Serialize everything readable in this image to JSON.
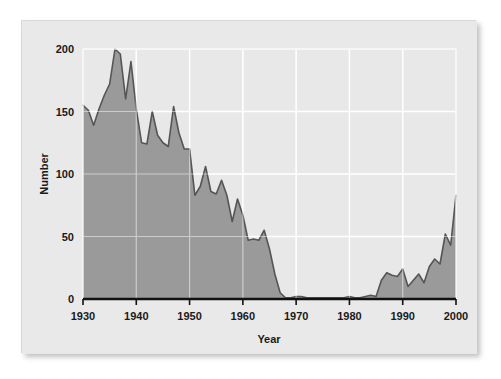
{
  "chart_data": {
    "type": "area",
    "title": "",
    "xlabel": "Year",
    "ylabel": "Number",
    "xlim": [
      1930,
      2000
    ],
    "ylim": [
      0,
      200
    ],
    "xticks": [
      1930,
      1940,
      1950,
      1960,
      1970,
      1980,
      1990,
      2000
    ],
    "xtick_labels": [
      "1930",
      "1940",
      "1950",
      "1960",
      "1970",
      "1980",
      "1990",
      "2000"
    ],
    "yticks": [
      0,
      50,
      100,
      150,
      200
    ],
    "ytick_labels": [
      "0",
      "50",
      "100",
      "150",
      "200"
    ],
    "grid": true,
    "legend": null,
    "legend_position": "none",
    "colors": {
      "plot_background": "#e8e8e8",
      "gridline": "#ffffff",
      "area_fill": "#9a9a9a",
      "line_stroke": "#555555",
      "baseline": "#111111",
      "card_background": "#e9e9e9",
      "page_background": "#ffffff",
      "text": "#1a1a1a"
    },
    "x": [
      1930,
      1931,
      1932,
      1933,
      1934,
      1935,
      1936,
      1937,
      1938,
      1939,
      1940,
      1941,
      1942,
      1943,
      1944,
      1945,
      1946,
      1947,
      1948,
      1949,
      1950,
      1951,
      1952,
      1953,
      1954,
      1955,
      1956,
      1957,
      1958,
      1959,
      1960,
      1961,
      1962,
      1963,
      1964,
      1965,
      1966,
      1967,
      1968,
      1969,
      1970,
      1971,
      1972,
      1973,
      1974,
      1975,
      1976,
      1977,
      1978,
      1979,
      1980,
      1981,
      1982,
      1983,
      1984,
      1985,
      1986,
      1987,
      1988,
      1989,
      1990,
      1991,
      1992,
      1993,
      1994,
      1995,
      1996,
      1997,
      1998,
      1999,
      2000
    ],
    "values": [
      155,
      151,
      139,
      152,
      163,
      172,
      200,
      196,
      160,
      190,
      152,
      125,
      124,
      150,
      131,
      125,
      122,
      154,
      133,
      120,
      120,
      83,
      90,
      106,
      86,
      84,
      95,
      83,
      62,
      80,
      67,
      47,
      48,
      47,
      55,
      40,
      20,
      5,
      1,
      1,
      2,
      2,
      1,
      1,
      1,
      1,
      1,
      1,
      1,
      1,
      2,
      1,
      1,
      2,
      3,
      2,
      15,
      21,
      19,
      18,
      24,
      10,
      15,
      20,
      13,
      26,
      32,
      28,
      52,
      43,
      83
    ],
    "series_name": "Number",
    "annotations": []
  },
  "axes": {
    "y_title": "Number",
    "x_title": "Year"
  }
}
